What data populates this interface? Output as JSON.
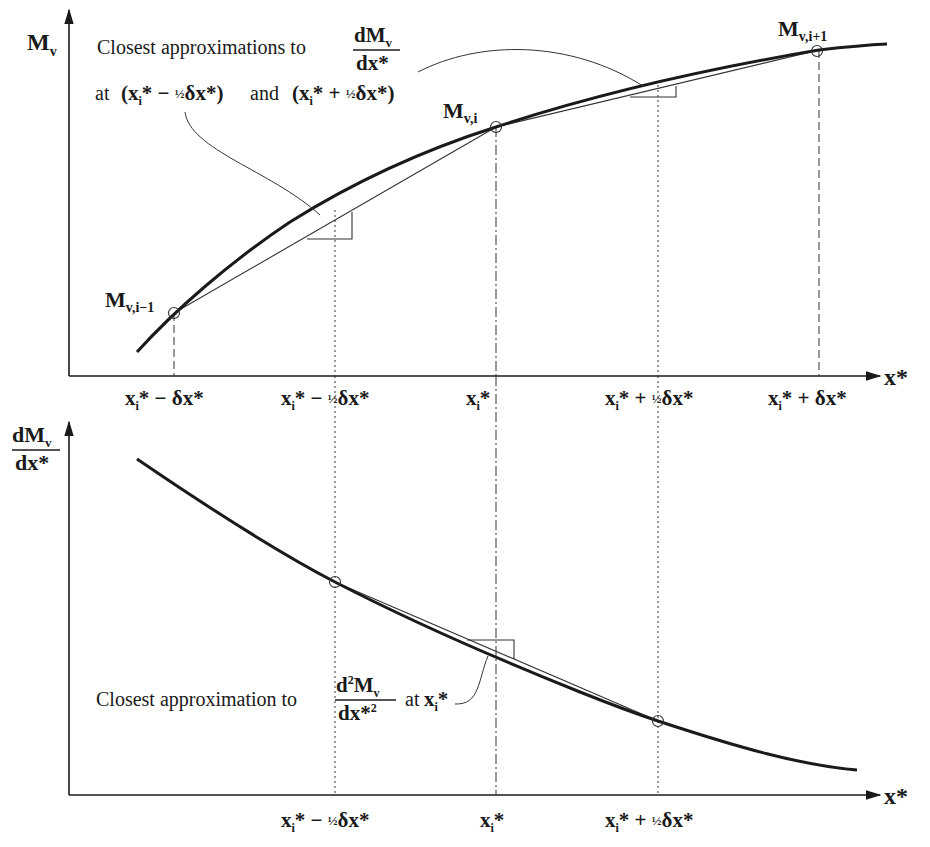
{
  "top_panel": {
    "y_axis_label": "M",
    "y_axis_label_sub": "v",
    "x_axis_label": "x*",
    "annotation": {
      "line1_prefix": "Closest approximations to",
      "fraction_num": "dM",
      "fraction_num_sub": "v",
      "fraction_den": "dx*",
      "line2_at": "at",
      "point_minus": "(x",
      "point_minus_rest": "* − ",
      "half": "½",
      "delta_term": "δx*)",
      "and": "and",
      "point_plus": "(x",
      "point_plus_rest": "* + "
    },
    "points": [
      {
        "label": "M",
        "sub": "v,i−1"
      },
      {
        "label": "M",
        "sub": "v,i"
      },
      {
        "label": "M",
        "sub": "v,i+1"
      }
    ],
    "ticks": [
      {
        "main": "x",
        "sub": "i",
        "rest": "* − δx*"
      },
      {
        "main": "x",
        "sub": "i",
        "rest": "* − ",
        "half": "½",
        "tail": "δx*"
      },
      {
        "main": "x",
        "sub": "i",
        "rest": "*"
      },
      {
        "main": "x",
        "sub": "i",
        "rest": "* + ",
        "half": "½",
        "tail": "δx*"
      },
      {
        "main": "x",
        "sub": "i",
        "rest": "* + δx*"
      }
    ]
  },
  "bottom_panel": {
    "y_axis_num": "dM",
    "y_axis_num_sub": "v",
    "y_axis_den": "dx*",
    "x_axis_label": "x*",
    "annotation": {
      "prefix": "Closest approximation to",
      "num": "d",
      "num_sup": "2",
      "num_main": "M",
      "num_sub": "v",
      "den": "dx*",
      "den_sup": "2",
      "at": "at",
      "point": "x",
      "point_sub": "i",
      "point_rest": "*"
    },
    "ticks": [
      {
        "main": "x",
        "sub": "i",
        "rest": "* − ",
        "half": "½",
        "tail": "δx*"
      },
      {
        "main": "x",
        "sub": "i",
        "rest": "*"
      },
      {
        "main": "x",
        "sub": "i",
        "rest": "* + ",
        "half": "½",
        "tail": "δx*"
      }
    ]
  },
  "colors": {
    "ink": "#1a1a1a",
    "thin": "#333333",
    "background": "#ffffff"
  }
}
